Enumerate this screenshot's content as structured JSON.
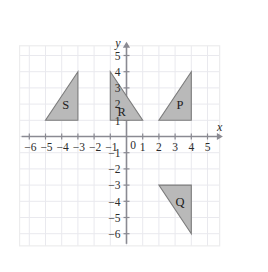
{
  "chart_data": {
    "type": "scatter",
    "title": "",
    "xlabel": "x",
    "ylabel": "y",
    "xlim": [
      -7,
      6
    ],
    "ylim": [
      -7,
      6
    ],
    "grid": true,
    "legend": "none",
    "x_ticks": [
      -6,
      -5,
      -4,
      -3,
      -2,
      -1,
      0,
      1,
      2,
      3,
      4,
      5
    ],
    "x_tick_labels": [
      "−6",
      "−5",
      "−4",
      "−3",
      "−2",
      "−1",
      "0",
      "1",
      "2",
      "3",
      "4",
      "5"
    ],
    "y_ticks": [
      5,
      4,
      3,
      2,
      1,
      -1,
      -2,
      -3,
      -4,
      -5,
      -6
    ],
    "y_tick_labels": [
      "5",
      "4",
      "3",
      "2",
      "1",
      "−1",
      "−2",
      "−3",
      "−4",
      "−5",
      "−6"
    ],
    "origin_label": "0",
    "shapes": [
      {
        "name": "S",
        "label": "S",
        "kind": "triangle",
        "vertices": [
          [
            -5,
            1
          ],
          [
            -3,
            1
          ],
          [
            -3,
            4
          ]
        ],
        "label_point": [
          -3.75,
          2.0
        ],
        "fill": "#b9b9b9",
        "stroke": "#7c7c7c"
      },
      {
        "name": "R",
        "label": "R",
        "kind": "triangle",
        "vertices": [
          [
            -1,
            1
          ],
          [
            -1,
            4
          ],
          [
            1,
            1
          ]
        ],
        "label_point": [
          -0.3,
          1.55
        ],
        "fill": "#b9b9b9",
        "stroke": "#7c7c7c"
      },
      {
        "name": "P",
        "label": "P",
        "kind": "triangle",
        "vertices": [
          [
            2,
            1
          ],
          [
            4,
            1
          ],
          [
            4,
            4
          ]
        ],
        "label_point": [
          3.3,
          2.0
        ],
        "fill": "#b9b9b9",
        "stroke": "#7c7c7c"
      },
      {
        "name": "Q",
        "label": "Q",
        "kind": "triangle",
        "vertices": [
          [
            2,
            -3
          ],
          [
            4,
            -3
          ],
          [
            4,
            -6
          ]
        ],
        "label_point": [
          3.3,
          -4.0
        ],
        "fill": "#b9b9b9",
        "stroke": "#7c7c7c"
      }
    ]
  },
  "axes": {
    "x_axis_name": "x",
    "y_axis_name": "y"
  },
  "colors": {
    "shape_fill": "#b9b9b9",
    "shape_stroke": "#7c7c7c",
    "grid": "#e9e9ee",
    "axis": "#8a8a92",
    "text": "#2b2b2b",
    "background": "#ffffff"
  }
}
